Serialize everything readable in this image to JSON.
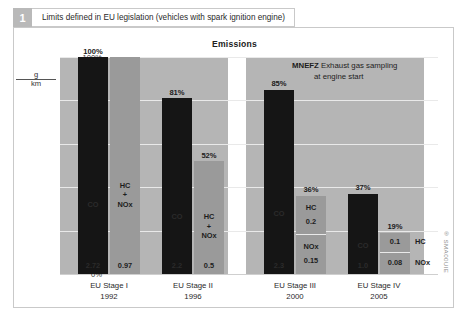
{
  "header": {
    "figure_number": "1",
    "title": "Limits defined in EU legislation (vehicles with spark ignition engine)"
  },
  "watermark": "® SMA00UIE",
  "chart_data": {
    "type": "bar",
    "title": "Emissions",
    "xlabel": "",
    "ylabel": "g/km",
    "ylabel_numerator": "g",
    "ylabel_denominator": "km",
    "ylim": [
      0,
      100
    ],
    "yticks": [
      "0%",
      "20%",
      "40%",
      "60%",
      "80%",
      "100%"
    ],
    "ytick_values": [
      0,
      20,
      40,
      60,
      80,
      100
    ],
    "grid": true,
    "legend": "none",
    "annotation": {
      "emphasis": "MNEFZ",
      "text": "Exhaust gas sampling at engine start",
      "line1": "Exhaust gas sampling",
      "line2": "at engine start"
    },
    "colors": {
      "dark_bar": "#151515",
      "light_bar": "#9a9a9a",
      "panel": "#b5b5b5",
      "figure_number_badge": "#b9b9b9"
    },
    "categories": [
      {
        "name": "EU Stage I",
        "year": "1992"
      },
      {
        "name": "EU Stage II",
        "year": "1996"
      },
      {
        "name": "EU Stage III",
        "year": "2000"
      },
      {
        "name": "EU Stage IV",
        "year": "2005"
      }
    ],
    "groups": [
      {
        "category": "EU Stage I",
        "year": "1992",
        "bars": [
          {
            "series": "CO",
            "percent": 100,
            "percent_label": "100%",
            "style": "dark",
            "segments": [
              {
                "label": "CO",
                "value": "2.72"
              }
            ]
          },
          {
            "series": "HC + NOx",
            "percent": 100,
            "percent_label": "",
            "style": "light",
            "segments": [
              {
                "label": "HC\n+\nNOx",
                "value": "0.97"
              }
            ]
          }
        ]
      },
      {
        "category": "EU Stage II",
        "year": "1996",
        "bars": [
          {
            "series": "CO",
            "percent": 81,
            "percent_label": "81%",
            "style": "dark",
            "segments": [
              {
                "label": "CO",
                "value": "2.2"
              }
            ]
          },
          {
            "series": "HC + NOx",
            "percent": 52,
            "percent_label": "52%",
            "style": "light",
            "segments": [
              {
                "label": "HC\n+\nNOx",
                "value": "0.5"
              }
            ]
          }
        ]
      },
      {
        "category": "EU Stage III",
        "year": "2000",
        "bars": [
          {
            "series": "CO",
            "percent": 85,
            "percent_label": "85%",
            "style": "dark",
            "segments": [
              {
                "label": "CO",
                "value": "2.3"
              }
            ]
          },
          {
            "series": "HC / NOx",
            "percent": 36,
            "percent_label": "36%",
            "style": "light",
            "segments": [
              {
                "label": "HC",
                "value": "0.2"
              },
              {
                "label": "NOx",
                "value": "0.15"
              }
            ]
          }
        ]
      },
      {
        "category": "EU Stage IV",
        "year": "2005",
        "bars": [
          {
            "series": "CO",
            "percent": 37,
            "percent_label": "37%",
            "style": "dark",
            "segments": [
              {
                "label": "CO",
                "value": "1.0"
              }
            ]
          },
          {
            "series": "HC / NOx",
            "percent": 19,
            "percent_label": "19%",
            "style": "light",
            "segments": [
              {
                "label": "HC",
                "value": "0.1"
              },
              {
                "label": "NOx",
                "value": "0.08"
              }
            ]
          }
        ]
      }
    ]
  }
}
